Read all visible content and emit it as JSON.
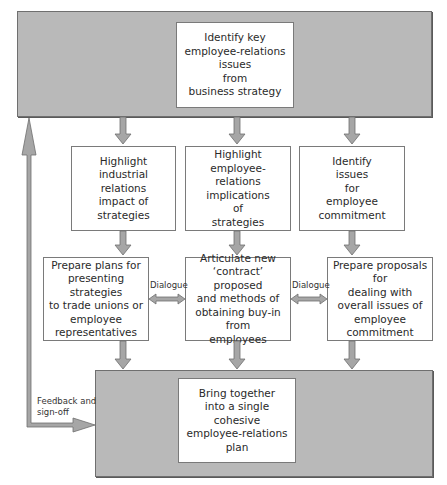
{
  "diagram": {
    "type": "flowchart",
    "top": {
      "text": "Identify key\nemployee-relations\nissues\nfrom\nbusiness strategy"
    },
    "row1": [
      {
        "text": "Highlight\nindustrial\nrelations\nimpact of\nstrategies"
      },
      {
        "text": "Highlight\nemployee-relations\nimplications\nof\nstrategies"
      },
      {
        "text": "Identify\nissues\nfor\nemployee\ncommitment"
      }
    ],
    "row2": [
      {
        "text": "Prepare plans for\npresenting strategies\nto trade unions or\nemployee\nrepresentatives"
      },
      {
        "text": "Articulate new\n‘contract’ proposed\nand methods of\nobtaining buy-in from\nemployees"
      },
      {
        "text": "Prepare proposals for\ndealing with\noverall issues of\nemployee\ncommitment"
      }
    ],
    "dialogue_labels": [
      "Dialogue",
      "Dialogue"
    ],
    "bottom": {
      "text": "Bring together\ninto a single\ncohesive\nemployee-relations\nplan"
    },
    "feedback_label": "Feedback and\nsign-off",
    "colors": {
      "band_fill": "#b9b9b9",
      "arrow_fill": "#a6a6a6",
      "border": "#6f6f6f",
      "box_fill": "#ffffff"
    }
  }
}
